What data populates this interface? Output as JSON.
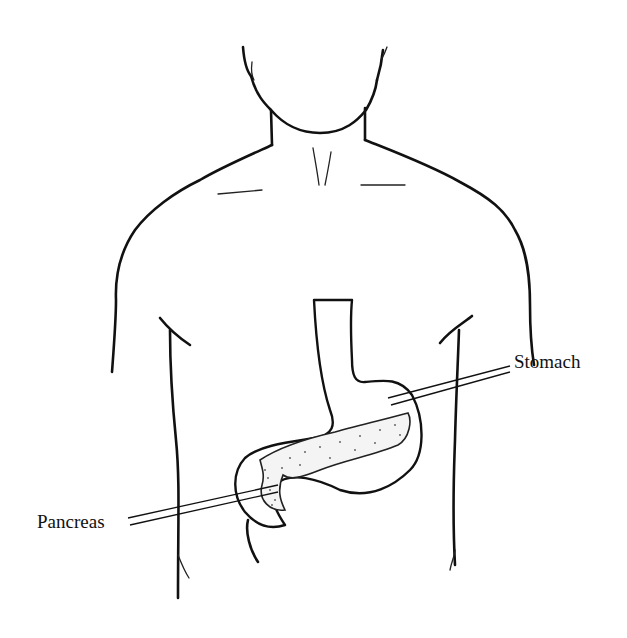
{
  "diagram": {
    "labels": [
      {
        "id": "stomach",
        "text": "Stomach"
      },
      {
        "id": "pancreas",
        "text": "Pancreas"
      }
    ],
    "colors": {
      "background": "#ffffff",
      "line": "#111111"
    }
  }
}
